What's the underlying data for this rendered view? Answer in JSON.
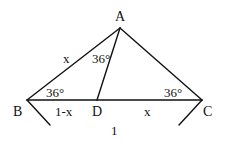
{
  "diagram": {
    "type": "geometry-triangle",
    "stroke_color": "#111111",
    "background": "#ffffff",
    "points": {
      "A": {
        "label": "A",
        "x": 120,
        "y": 28
      },
      "B": {
        "label": "B",
        "x": 27,
        "y": 100
      },
      "C": {
        "label": "C",
        "x": 202,
        "y": 100
      },
      "D": {
        "label": "D",
        "x": 97,
        "y": 100
      }
    },
    "segments": [
      {
        "from": "A",
        "to": "B"
      },
      {
        "from": "A",
        "to": "C"
      },
      {
        "from": "B",
        "to": "C"
      },
      {
        "from": "A",
        "to": "D"
      }
    ],
    "side_labels": {
      "AB": "x",
      "BD": "1-x",
      "DC": "x",
      "BC": "1"
    },
    "angle_labels": {
      "B": "36°",
      "C": "36°",
      "DAB": "36°"
    },
    "brace": {
      "label": "1",
      "left_arm": {
        "x1": 27,
        "y1": 100,
        "x2": 50,
        "y2": 125
      },
      "right_arm": {
        "x1": 202,
        "y1": 100,
        "x2": 179,
        "y2": 125
      }
    }
  }
}
